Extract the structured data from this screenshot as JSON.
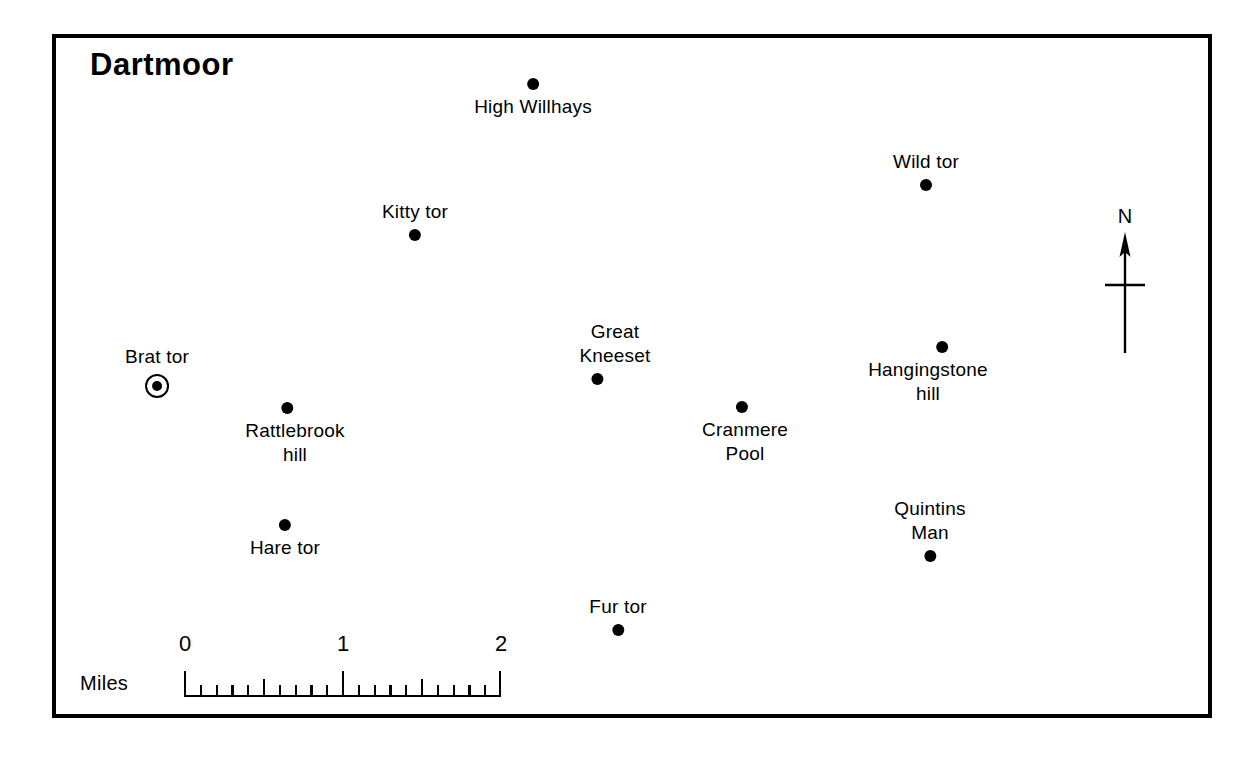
{
  "map": {
    "title": "Dartmoor",
    "frame": {
      "border_color": "#000000",
      "background": "#ffffff"
    },
    "places": [
      {
        "name": "High Willhays",
        "lines": [
          "High Willhays"
        ],
        "dot": "below-label-no",
        "dot_position": "above",
        "marker": "dot",
        "x": 533,
        "y": 84
      },
      {
        "name": "Wild tor",
        "lines": [
          "Wild tor"
        ],
        "dot_position": "below",
        "marker": "dot",
        "x": 926,
        "y": 198
      },
      {
        "name": "Kitty tor",
        "lines": [
          "Kitty tor"
        ],
        "dot_position": "below",
        "marker": "dot",
        "x": 415,
        "y": 248
      },
      {
        "name": "Great Kneeset",
        "lines": [
          "Great",
          "Kneeset"
        ],
        "dot_position": "below",
        "marker": "dot",
        "x": 627,
        "y": 389
      },
      {
        "name": "Brat tor",
        "lines": [
          "Brat tor"
        ],
        "dot_position": "below",
        "marker": "ringed-dot",
        "x": 162,
        "y": 395
      },
      {
        "name": "Cranmere Pool",
        "lines": [
          "Cranmere",
          "Pool"
        ],
        "dot_position": "above",
        "marker": "dot",
        "x": 762,
        "y": 407
      },
      {
        "name": "Hangingstone hill",
        "lines": [
          "Hangingstone",
          "hill"
        ],
        "dot_position": "above",
        "marker": "dot",
        "x": 908,
        "y": 347
      },
      {
        "name": "Rattlebrook hill",
        "lines": [
          "Rattlebrook",
          "hill"
        ],
        "dot_position": "above",
        "marker": "dot",
        "x": 313,
        "y": 408
      },
      {
        "name": "Hare tor",
        "lines": [
          "Hare tor"
        ],
        "dot_position": "above",
        "marker": "dot",
        "x": 282,
        "y": 525
      },
      {
        "name": "Quintins Man",
        "lines": [
          "Quintins",
          "Man"
        ],
        "dot_position": "below",
        "marker": "dot",
        "x": 930,
        "y": 567
      },
      {
        "name": "Fur tor",
        "lines": [
          "Fur tor"
        ],
        "dot_position": "below",
        "marker": "dot",
        "x": 618,
        "y": 641
      }
    ],
    "north_arrow": {
      "label": "N"
    },
    "scale_bar": {
      "unit_label": "Miles",
      "tick_labels": [
        "0",
        "1",
        "2"
      ],
      "min": 0,
      "max": 2,
      "minor_step": 0.1,
      "major_step": 0.5
    }
  },
  "places_text": {
    "p0_l0": "High Willhays",
    "p1_l0": "Wild tor",
    "p2_l0": "Kitty tor",
    "p3_l0": "Great",
    "p3_l1": "Kneeset",
    "p4_l0": "Brat tor",
    "p5_l0": "Cranmere",
    "p5_l1": "Pool",
    "p6_l0": "Hangingstone",
    "p6_l1": "hill",
    "p7_l0": "Rattlebrook",
    "p7_l1": "hill",
    "p8_l0": "Hare tor",
    "p9_l0": "Quintins",
    "p9_l1": "Man",
    "p10_l0": "Fur tor"
  }
}
